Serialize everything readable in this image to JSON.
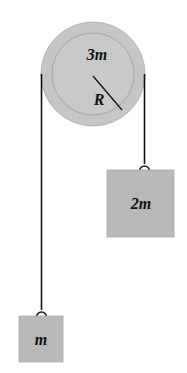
{
  "diagram": {
    "type": "atwood-pulley",
    "pulley": {
      "mass_label": "3m",
      "radius_label": "R",
      "cx": 93,
      "cy": 74,
      "r_outer": 52,
      "r_inner": 41,
      "fill": "#c6c6c6",
      "ring_stroke": "#a8a8a8"
    },
    "left_mass": {
      "label": "m",
      "x": 19,
      "y": 316,
      "w": 44,
      "h": 46,
      "string_x": 41
    },
    "right_mass": {
      "label": "2m",
      "x": 107,
      "y": 170,
      "w": 67,
      "h": 67,
      "string_x": 144
    },
    "colors": {
      "box_fill": "#b9b9b9",
      "string": "#111111"
    }
  }
}
